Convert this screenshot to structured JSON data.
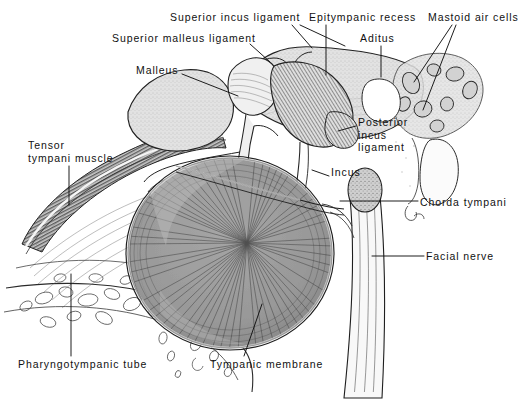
{
  "figure": {
    "background_color": "#ffffff",
    "ink_color": "#111111",
    "width": 523,
    "height": 399
  },
  "palette": {
    "background": "#ffffff",
    "line": "#1a1a1a",
    "stipple_light": "#d8d8d8",
    "stipple_mid": "#bdbdbd",
    "membrane_fill": "#9e9e9e",
    "membrane_dark": "#7d7d7d",
    "muscle_fill": "#8a8a8a",
    "bone_light": "#ececec",
    "nerve_fill": "#f2f2f2"
  },
  "labels": [
    {
      "id": "superior-incus-ligament",
      "text": "Superior incus ligament",
      "x": 170,
      "y": 11,
      "align": "left",
      "leaders": [
        [
          [
            292,
            25
          ],
          [
            312,
            48
          ]
        ],
        [
          [
            300,
            25
          ],
          [
            345,
            46
          ]
        ]
      ]
    },
    {
      "id": "epitympanic-recess",
      "text": "Epitympanic recess",
      "x": 309,
      "y": 11,
      "align": "left",
      "leaders": [
        [
          [
            326,
            25
          ],
          [
            326,
            75
          ]
        ]
      ]
    },
    {
      "id": "mastoid-air-cells",
      "text": "Mastoid air cells",
      "x": 428,
      "y": 11,
      "align": "left",
      "leaders": [
        [
          [
            452,
            25
          ],
          [
            414,
            82
          ]
        ],
        [
          [
            456,
            25
          ],
          [
            423,
            110
          ]
        ]
      ]
    },
    {
      "id": "superior-malleus-ligament",
      "text": "Superior malleus ligament",
      "x": 112,
      "y": 32,
      "align": "left",
      "leaders": [
        [
          [
            250,
            44
          ],
          [
            270,
            62
          ]
        ]
      ]
    },
    {
      "id": "aditus",
      "text": "Aditus",
      "x": 360,
      "y": 32,
      "align": "left",
      "leaders": [
        [
          [
            381,
            46
          ],
          [
            381,
            77
          ]
        ]
      ]
    },
    {
      "id": "malleus",
      "text": "Malleus",
      "x": 136,
      "y": 64,
      "align": "left",
      "leaders": [
        [
          [
            182,
            74
          ],
          [
            238,
            96
          ]
        ]
      ]
    },
    {
      "id": "posterior-incus-ligament",
      "text": "Posterior\nincus\nligament",
      "x": 358,
      "y": 116,
      "align": "left",
      "leaders": [
        [
          [
            356,
            126
          ],
          [
            338,
            131
          ]
        ]
      ]
    },
    {
      "id": "tensor-tympani-muscle",
      "text": "Tensor\ntympani muscle",
      "x": 28,
      "y": 139,
      "align": "left",
      "leaders": [
        [
          [
            69,
            166
          ],
          [
            69,
            205
          ]
        ]
      ]
    },
    {
      "id": "incus",
      "text": "Incus",
      "x": 331,
      "y": 166,
      "align": "left",
      "leaders": [
        [
          [
            329,
            176
          ],
          [
            312,
            170
          ]
        ]
      ]
    },
    {
      "id": "chorda-tympani",
      "text": "Chorda tympani",
      "x": 420,
      "y": 196,
      "align": "left",
      "leaders": [
        [
          [
            418,
            201
          ],
          [
            340,
            201
          ]
        ]
      ]
    },
    {
      "id": "facial-nerve",
      "text": "Facial nerve",
      "x": 426,
      "y": 250,
      "align": "left",
      "leaders": [
        [
          [
            424,
            256
          ],
          [
            372,
            256
          ]
        ]
      ]
    },
    {
      "id": "pharyngotympanic-tube",
      "text": "Pharyngotympanic tube",
      "x": 18,
      "y": 358,
      "align": "left",
      "leaders": [
        [
          [
            71,
            356
          ],
          [
            71,
            274
          ]
        ]
      ]
    },
    {
      "id": "tympanic-membrane",
      "text": "Tympanic membrane",
      "x": 210,
      "y": 358,
      "align": "left",
      "leaders": [
        [
          [
            244,
            356
          ],
          [
            262,
            304
          ]
        ]
      ]
    }
  ],
  "structures": [
    {
      "id": "epitympanic-recess-mass",
      "name": "Epitympanic recess",
      "fill": "#dcdcdc"
    },
    {
      "id": "tympanic-membrane",
      "name": "Tympanic membrane",
      "fill": "#9c9c9c"
    },
    {
      "id": "malleus-bone",
      "name": "Malleus",
      "fill": "#ededed"
    },
    {
      "id": "incus-bone",
      "name": "Incus",
      "fill": "#c8c8c8"
    },
    {
      "id": "tensor-tympani-muscle-band",
      "name": "Tensor tympani muscle",
      "fill": "#8f8f8f"
    },
    {
      "id": "facial-nerve-canal",
      "name": "Facial nerve",
      "fill": "#f4f4f4"
    },
    {
      "id": "mastoid-air-cells-group",
      "name": "Mastoid air cells",
      "fill": "#e8e8e8"
    },
    {
      "id": "pharyngotympanic-tube-wall",
      "name": "Pharyngotympanic tube",
      "fill": "#ffffff"
    }
  ]
}
